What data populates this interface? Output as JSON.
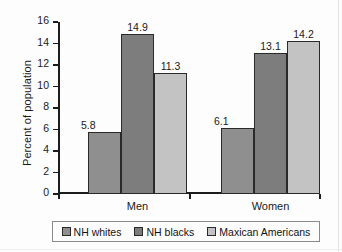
{
  "chart_data": {
    "type": "bar",
    "title": "",
    "subtitle": "",
    "xlabel": "",
    "ylabel": "Percent of population",
    "categories": [
      "Men",
      "Women"
    ],
    "series": [
      {
        "name": "NH whites",
        "values": [
          5.8,
          6.1
        ],
        "color": "#8f8f8f"
      },
      {
        "name": "NH blacks",
        "values": [
          14.9,
          13.1
        ],
        "color": "#7d7d7d"
      },
      {
        "name": "Maxican Americans",
        "values": [
          11.3,
          14.2
        ],
        "color": "#c3c3c3"
      }
    ],
    "ylim": [
      0,
      16
    ],
    "ytick_labels": [
      "0",
      "2",
      "4",
      "6",
      "8",
      "10",
      "12",
      "14",
      "16"
    ],
    "ytick_values": [
      0,
      2,
      4,
      6,
      8,
      10,
      12,
      14,
      16
    ],
    "grid": false,
    "legend_position": "bottom",
    "value_labels": [
      {
        "group": "Men",
        "series": "NH whites",
        "label": "5.8"
      },
      {
        "group": "Men",
        "series": "NH blacks",
        "label": "14.9"
      },
      {
        "group": "Men",
        "series": "Maxican Americans",
        "label": "11.3"
      },
      {
        "group": "Women",
        "series": "NH whites",
        "label": "6.1"
      },
      {
        "group": "Women",
        "series": "NH blacks",
        "label": "13.1"
      },
      {
        "group": "Women",
        "series": "Maxican Americans",
        "label": "14.2"
      }
    ]
  },
  "axis": {
    "y_title": "Percent of population",
    "y_ticks": [
      "16",
      "14",
      "12",
      "10",
      "8",
      "6",
      "4",
      "2",
      "0"
    ]
  },
  "groups": [
    {
      "label": "Men",
      "values": [
        "5.8",
        "14.9",
        "11.3"
      ]
    },
    {
      "label": "Women",
      "values": [
        "6.1",
        "13.1",
        "14.2"
      ]
    }
  ],
  "legend": {
    "items": [
      {
        "label": "NH whites",
        "color": "#8f8f8f"
      },
      {
        "label": "NH blacks",
        "color": "#7d7d7d"
      },
      {
        "label": "Maxican Americans",
        "color": "#c3c3c3"
      }
    ]
  }
}
